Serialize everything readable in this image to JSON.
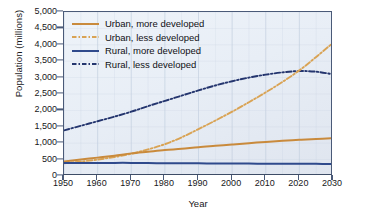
{
  "chart_data": {
    "type": "line",
    "title": "",
    "xlabel": "Year",
    "ylabel": "Population (millions)",
    "xlim": [
      1950,
      2030
    ],
    "ylim": [
      0,
      5000
    ],
    "ytick_labels": [
      "0",
      "500",
      "1,000",
      "1,500",
      "2,000",
      "2,500",
      "3,000",
      "3,500",
      "4,000",
      "4,500",
      "5,000"
    ],
    "ytick_values": [
      0,
      500,
      1000,
      1500,
      2000,
      2500,
      3000,
      3500,
      4000,
      4500,
      5000
    ],
    "xtick_labels": [
      "1950",
      "1960",
      "1970",
      "1980",
      "1990",
      "2000",
      "2010",
      "2020",
      "2030"
    ],
    "xtick_values": [
      1950,
      1960,
      1970,
      1980,
      1990,
      2000,
      2010,
      2020,
      2030
    ],
    "grid": "vertical-faint",
    "legend_position": "top-left-inside",
    "x": [
      1950,
      1955,
      1960,
      1965,
      1970,
      1975,
      1980,
      1985,
      1990,
      1995,
      2000,
      2005,
      2010,
      2015,
      2020,
      2025,
      2030
    ],
    "series": [
      {
        "name": "Urban, more developed",
        "color": "#c98a3c",
        "style": "solid",
        "values": [
          440,
          500,
          560,
          620,
          690,
          740,
          790,
          830,
          880,
          920,
          960,
          1000,
          1040,
          1075,
          1105,
          1130,
          1150
        ]
      },
      {
        "name": "Urban, less developed",
        "color": "#d9a354",
        "style": "dash-dot",
        "values": [
          390,
          440,
          500,
          580,
          680,
          810,
          970,
          1180,
          1430,
          1690,
          1960,
          2250,
          2550,
          2870,
          3220,
          3630,
          4060
        ]
      },
      {
        "name": "Rural, more developed",
        "color": "#2f4a8c",
        "style": "solid",
        "values": [
          400,
          400,
          400,
          400,
          400,
          395,
          390,
          388,
          385,
          383,
          380,
          378,
          376,
          374,
          372,
          370,
          368
        ]
      },
      {
        "name": "Rural, less developed",
        "color": "#24356e",
        "style": "dash-dot",
        "values": [
          1390,
          1530,
          1670,
          1810,
          1960,
          2130,
          2290,
          2450,
          2610,
          2760,
          2890,
          3000,
          3090,
          3160,
          3200,
          3180,
          3100
        ]
      }
    ]
  },
  "legend": {
    "items": [
      {
        "label": "Urban, more developed"
      },
      {
        "label": "Urban, less developed"
      },
      {
        "label": "Rural, more developed"
      },
      {
        "label": "Rural, less developed"
      }
    ]
  },
  "axes": {
    "x_title": "Year",
    "y_title": "Population (millions)"
  },
  "colors": {
    "urban_more": "#c98a3c",
    "urban_less": "#d9a354",
    "rural_more": "#2f4a8c",
    "rural_less": "#24356e",
    "plot_background": "#e8eef6",
    "axis": "#4a5a78",
    "page_background": "#ffffff"
  }
}
